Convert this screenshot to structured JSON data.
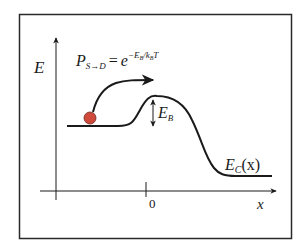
{
  "diagram": {
    "axes": {
      "y_label": "E",
      "x_label": "x",
      "x_tick": "0"
    },
    "formula": {
      "lhs_main": "P",
      "lhs_sub": "S→D",
      "equals": "=",
      "base": "e",
      "exponent": "−E",
      "exp_sub1": "B",
      "exp_slash": "/k",
      "exp_sub2": "B",
      "exp_T": "T"
    },
    "barrier_label": {
      "main": "E",
      "sub": "B"
    },
    "band_label": {
      "main": "E",
      "sub": "C",
      "arg": "(x)"
    },
    "colors": {
      "stroke": "#1a1a1a",
      "ball": "#d04a3c",
      "frame": "#2a2a2a",
      "background": "#ffffff"
    }
  }
}
